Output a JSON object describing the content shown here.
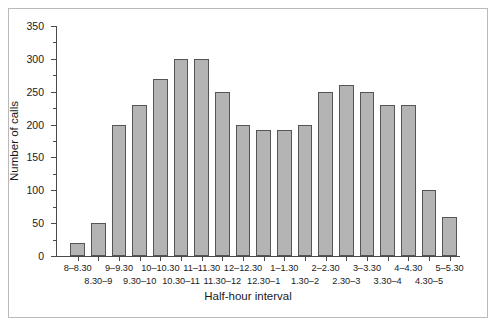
{
  "chart_data": {
    "type": "bar",
    "title": "",
    "xlabel": "Half-hour interval",
    "ylabel": "Number of calls",
    "ylim": [
      0,
      350
    ],
    "ytick_labels": [
      "0",
      "50",
      "100",
      "150",
      "200",
      "250",
      "300",
      "350"
    ],
    "ytick_values": [
      0,
      50,
      100,
      150,
      200,
      250,
      300,
      350
    ],
    "yminor_values": [
      25,
      75,
      125,
      175,
      225,
      275,
      325
    ],
    "grid": false,
    "legend": null,
    "bar_color": "#b4b4b4",
    "bar_edge_color": "#555555",
    "categories": [
      "8–8.30",
      "8.30–9",
      "9–9.30",
      "9.30–10",
      "10–10.30",
      "10.30–11",
      "11–11.30",
      "11.30–12",
      "12–12.30",
      "12.30–1",
      "1–1.30",
      "1.30–2",
      "2–2.30",
      "2.30–3",
      "3–3.30",
      "3.30–4",
      "4–4.30",
      "4.30–5",
      "5–5.30"
    ],
    "values": [
      20,
      50,
      200,
      230,
      270,
      300,
      300,
      250,
      200,
      192,
      192,
      200,
      250,
      260,
      250,
      230,
      230,
      100,
      60
    ]
  },
  "figure": {
    "frame_color": "#b9b9b9",
    "background": "#ffffff"
  }
}
